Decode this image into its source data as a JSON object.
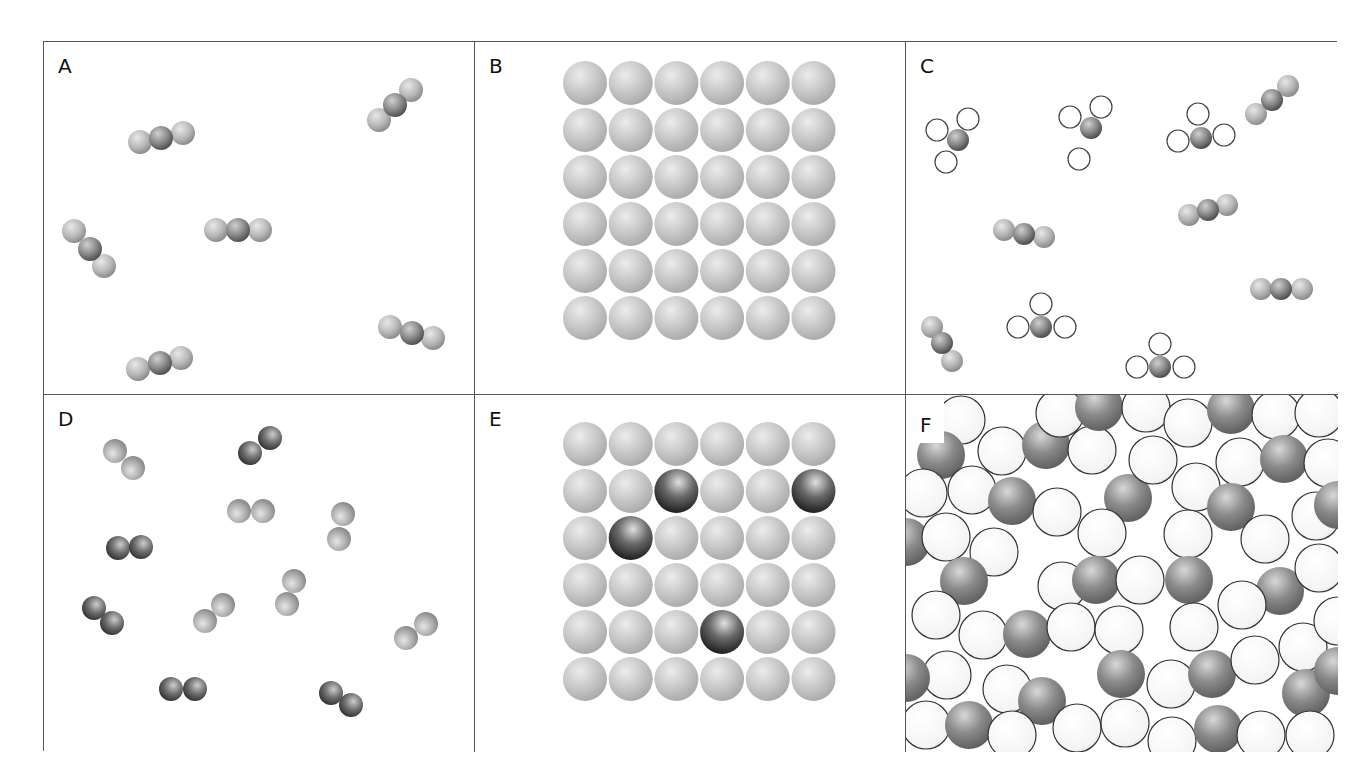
{
  "figure": {
    "caption_fragment": "",
    "panels": [
      {
        "id": "A",
        "label": "A",
        "description": "gas of triatomic molecules (linear, dark central atom)"
      },
      {
        "id": "B",
        "label": "B",
        "description": "6x6 lattice of identical light atoms"
      },
      {
        "id": "C",
        "label": "C",
        "description": "mixture of triatomic linear molecules and tetra-atomic molecules with open outer atoms"
      },
      {
        "id": "D",
        "label": "D",
        "description": "gas of diatomic molecules"
      },
      {
        "id": "E",
        "label": "E",
        "description": "6x6 lattice of light atoms with 4 dark substituted atoms"
      },
      {
        "id": "F",
        "label": "F",
        "description": "dense random mixture of open and dark shaded spheres"
      }
    ],
    "colors": {
      "border": "#555555",
      "light_atom": "#c4c4c4",
      "mid_atom": "#9a9a9a",
      "dark_atom": "#4a4a4a",
      "open_atom_fill": "#ffffff",
      "open_atom_stroke": "#444444"
    }
  }
}
